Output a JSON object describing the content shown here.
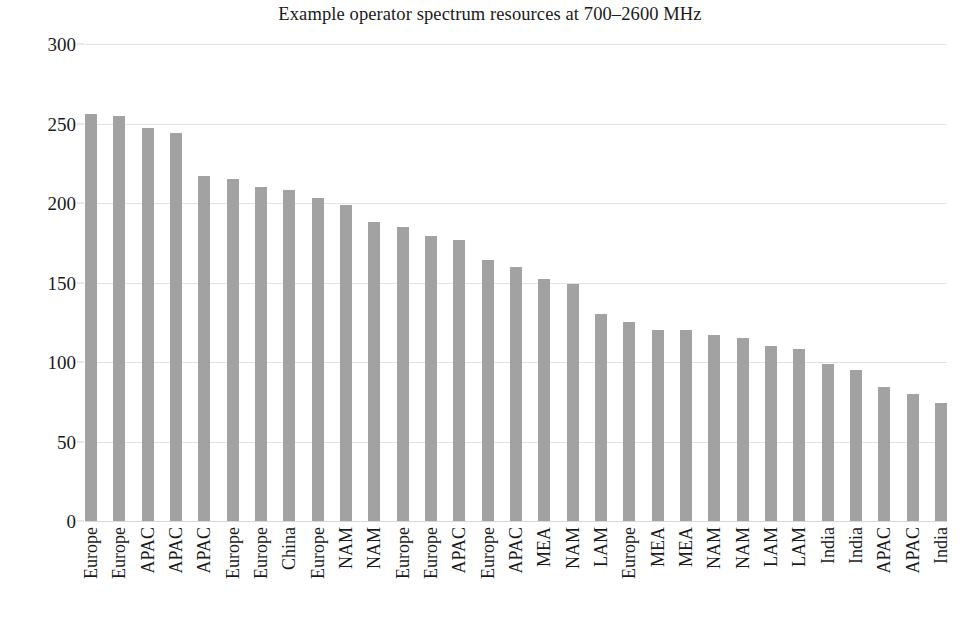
{
  "chart_data": {
    "type": "bar",
    "title": "Example operator spectrum resources at 700–2600 MHz",
    "xlabel": "",
    "ylabel": "",
    "ylim": [
      0,
      300
    ],
    "yticks": [
      0,
      50,
      100,
      150,
      200,
      250,
      300
    ],
    "ytick_labels": [
      "0",
      "50",
      "100",
      "150",
      "200",
      "250",
      "300"
    ],
    "grid": true,
    "legend": "none",
    "bar_color": "#a2a2a2",
    "gridline_color": "#e2e2e2",
    "text_color": "#1a1a1a",
    "background_color": "#ffffff",
    "categories": [
      "Europe",
      "Europe",
      "APAC",
      "APAC",
      "APAC",
      "Europe",
      "Europe",
      "China",
      "Europe",
      "NAM",
      "NAM",
      "Europe",
      "Europe",
      "APAC",
      "Europe",
      "APAC",
      "MEA",
      "NAM",
      "LAM",
      "Europe",
      "MEA",
      "MEA",
      "NAM",
      "NAM",
      "LAM",
      "LAM",
      "India",
      "India",
      "APAC",
      "APAC",
      "India"
    ],
    "values": [
      256,
      255,
      247,
      244,
      217,
      215,
      210,
      208,
      203,
      199,
      188,
      185,
      179,
      177,
      164,
      160,
      152,
      149,
      130,
      125,
      120,
      120,
      117,
      115,
      110,
      108,
      99,
      95,
      84,
      80,
      74
    ]
  }
}
